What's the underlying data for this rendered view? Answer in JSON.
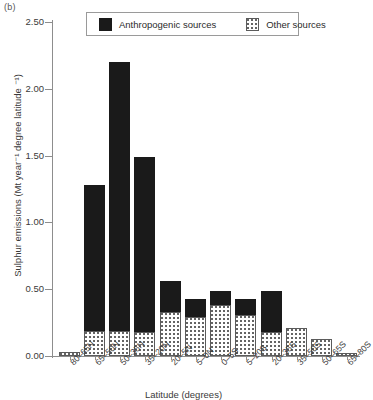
{
  "panel": {
    "letter": "(b)"
  },
  "legend": {
    "entries": [
      {
        "key": "anthropogenic",
        "label": "Anthropogenic sources",
        "style": "solid-black",
        "color": "#1a1a1a"
      },
      {
        "key": "other",
        "label": "Other sources",
        "style": "dotted-white",
        "color": "#ffffff"
      }
    ]
  },
  "chart_data": {
    "type": "bar",
    "stacked": true,
    "title": "",
    "xlabel": "Latitude (degrees)",
    "ylabel": "Sulphur emissions (Mt year⁻¹ degree latitude ⁻¹)",
    "ylim": [
      0.0,
      2.5
    ],
    "yticks": [
      0.0,
      0.5,
      1.0,
      1.5,
      2.0,
      2.5
    ],
    "ytick_labels": [
      "0.00",
      "0.50",
      "1.00",
      "1.50",
      "2.00",
      "2.50"
    ],
    "grid": false,
    "legend_position": "top-center",
    "categories": [
      "80–65N",
      "65–50N",
      "50–35N",
      "35–20N",
      "20–5N",
      "5–0N",
      "0–5S",
      "5–20S",
      "20–35S",
      "35–50S",
      "50–65S",
      "65–80S"
    ],
    "series": [
      {
        "name": "Other sources",
        "values": [
          0.03,
          0.19,
          0.19,
          0.18,
          0.33,
          0.29,
          0.38,
          0.31,
          0.18,
          0.21,
          0.13,
          0.02
        ]
      },
      {
        "name": "Anthropogenic sources",
        "values": [
          0.0,
          1.09,
          2.01,
          1.31,
          0.23,
          0.14,
          0.11,
          0.12,
          0.31,
          0.0,
          0.0,
          0.0
        ]
      }
    ],
    "totals": [
      0.03,
      1.28,
      2.2,
      1.49,
      0.56,
      0.43,
      0.49,
      0.43,
      0.49,
      0.21,
      0.13,
      0.02
    ]
  }
}
